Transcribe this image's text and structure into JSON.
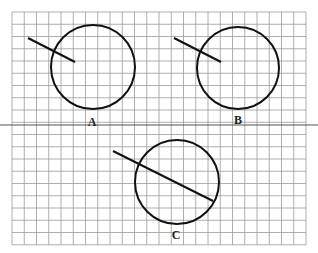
{
  "diagram": {
    "grid": {
      "x0": 12,
      "y0": 12,
      "cols": 24,
      "rows": 19,
      "cell": 12.25,
      "divider_row_y": 125
    },
    "figures": [
      {
        "label": "A",
        "circle": {
          "cx": 93,
          "cy": 67,
          "r": 42
        },
        "line": {
          "x1": 28,
          "y1": 38,
          "x2": 75,
          "y2": 62
        },
        "label_pos": {
          "x": 92,
          "y": 126
        }
      },
      {
        "label": "B",
        "circle": {
          "cx": 238,
          "cy": 68,
          "r": 41
        },
        "line": {
          "x1": 174,
          "y1": 38,
          "x2": 221,
          "y2": 62
        },
        "label_pos": {
          "x": 238,
          "y": 124
        }
      },
      {
        "label": "C",
        "circle": {
          "cx": 177,
          "cy": 182,
          "r": 42
        },
        "line": {
          "x1": 113,
          "y1": 151,
          "x2": 213,
          "y2": 201
        },
        "label_pos": {
          "x": 176,
          "y": 239
        }
      }
    ],
    "colors": {
      "grid": "#9a9a9a",
      "divider": "#555555",
      "stroke": "#111111"
    }
  }
}
